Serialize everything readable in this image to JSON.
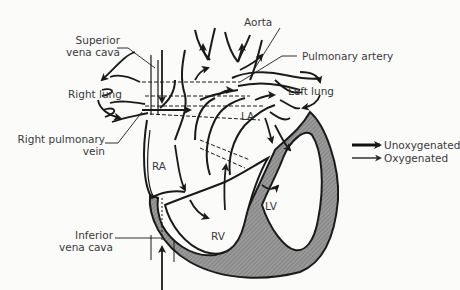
{
  "diagram": {
    "labels": {
      "superior_vena_cava_line1": "Superior",
      "superior_vena_cava_line2": "vena cava",
      "aorta": "Aorta",
      "pulmonary_artery": "Pulmonary artery",
      "right_lung": "Right lung",
      "left_lung": "Left lung",
      "right_pulmonary_vein_line1": "Right pulmonary",
      "right_pulmonary_vein_line2": "vein",
      "inferior_vena_cava_line1": "Inferior",
      "inferior_vena_cava_line2": "vena cava",
      "ra": "RA",
      "la": "LA",
      "rv": "RV",
      "lv": "LV"
    },
    "legend": [
      {
        "label": "Unoxygenated",
        "style": "bold-arrow"
      },
      {
        "label": "Oxygenated",
        "style": "thin-arrow"
      }
    ],
    "colors": {
      "ink": "#1a1a1a",
      "wall": "#8a8a8a",
      "text": "#3a3a3a",
      "background": "#fbfbfa"
    }
  }
}
